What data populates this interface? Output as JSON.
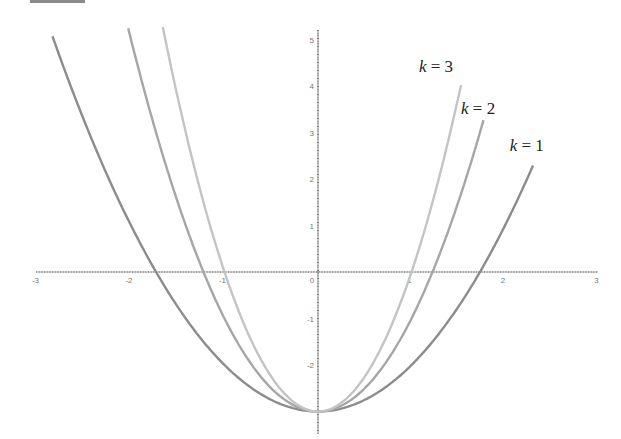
{
  "chart_data": {
    "type": "line",
    "title": "",
    "xlabel": "",
    "ylabel": "",
    "xlim": [
      -3,
      3
    ],
    "ylim": [
      -3.3,
      5
    ],
    "grid": false,
    "x_ticks": [
      "-3",
      "-2",
      "-1",
      "0",
      "1",
      "2",
      "3"
    ],
    "y_ticks": [
      "5",
      "4",
      "3",
      "2",
      "1",
      "0",
      "-1",
      "-2"
    ],
    "function": "y = k x^2 - 3",
    "series": [
      {
        "name": "k = 1",
        "k": 1,
        "color": "#8c8c8c",
        "x_range": [
          -2.84,
          2.3
        ],
        "label_pos": [
          2.05,
          2.6
        ]
      },
      {
        "name": "k = 2",
        "k": 2,
        "color": "#a6a6a6",
        "x_range": [
          -2.03,
          1.77
        ],
        "label_pos": [
          1.53,
          3.4
        ]
      },
      {
        "name": "k = 3",
        "k": 3,
        "color": "#c4c4c4",
        "x_range": [
          -1.66,
          1.53
        ],
        "label_pos": [
          1.08,
          4.3
        ]
      }
    ],
    "legend": "inline labels near curve ends (upper right)"
  },
  "labels": {
    "k1": "k = 1",
    "k2": "k = 2",
    "k3": "k = 3"
  }
}
